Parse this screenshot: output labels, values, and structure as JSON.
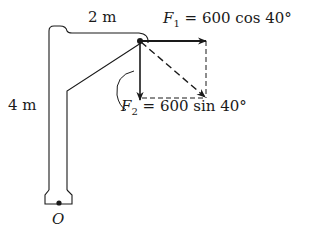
{
  "figure": {
    "dimension_horizontal": "2 m",
    "dimension_vertical": "4 m",
    "origin_label": "O",
    "force1": {
      "symbol": "F",
      "subscript": "1",
      "expression": " = 600 cos 40°"
    },
    "force2": {
      "symbol": "F",
      "subscript": "2",
      "expression": " = 600 sin 40°"
    },
    "colors": {
      "ink": "#1a1a1a",
      "background": "#ffffff"
    }
  }
}
